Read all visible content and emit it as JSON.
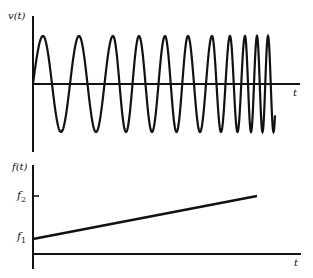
{
  "figure": {
    "top_panel": {
      "ylabel": "v(t)",
      "xlabel": "t",
      "signal": "chirp",
      "peak_x_positions": [
        43,
        79,
        113,
        139,
        165,
        188,
        212,
        230,
        245,
        257,
        268
      ]
    },
    "bottom_panel": {
      "ylabel": "f(t)",
      "xlabel": "t",
      "tick_labels": [
        "f2",
        "f1"
      ],
      "f1_label": "f",
      "f1_sub": "1",
      "f2_label": "f",
      "f2_sub": "2"
    }
  },
  "colors": {
    "stroke": "#111111",
    "background": "#ffffff"
  }
}
